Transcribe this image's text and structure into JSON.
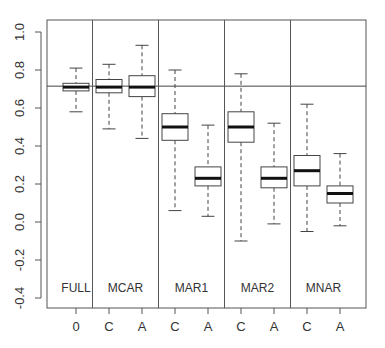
{
  "chart_data": {
    "type": "boxplot",
    "title": "",
    "xlabel": "",
    "ylabel": "",
    "ylim": [
      -0.45,
      1.05
    ],
    "yticks": [
      -0.4,
      -0.2,
      0.0,
      0.2,
      0.4,
      0.6,
      0.8,
      1.0
    ],
    "ytick_labels": [
      "-0.4",
      "-0.2",
      "0.0",
      "0.2",
      "0.4",
      "0.6",
      "0.8",
      "1.0"
    ],
    "reference_line": 0.715,
    "grid": false,
    "groups": [
      {
        "name": "FULL",
        "boxes": [
          {
            "label": "0",
            "whisker_high": 0.81,
            "q3": 0.73,
            "median": 0.71,
            "q1": 0.69,
            "whisker_low": 0.58
          }
        ]
      },
      {
        "name": "MCAR",
        "boxes": [
          {
            "label": "C",
            "whisker_high": 0.83,
            "q3": 0.75,
            "median": 0.71,
            "q1": 0.68,
            "whisker_low": 0.49
          },
          {
            "label": "A",
            "whisker_high": 0.93,
            "q3": 0.77,
            "median": 0.71,
            "q1": 0.66,
            "whisker_low": 0.44
          }
        ]
      },
      {
        "name": "MAR1",
        "boxes": [
          {
            "label": "C",
            "whisker_high": 0.8,
            "q3": 0.57,
            "median": 0.5,
            "q1": 0.43,
            "whisker_low": 0.06
          },
          {
            "label": "A",
            "whisker_high": 0.51,
            "q3": 0.29,
            "median": 0.23,
            "q1": 0.19,
            "whisker_low": 0.03
          }
        ]
      },
      {
        "name": "MAR2",
        "boxes": [
          {
            "label": "C",
            "whisker_high": 0.78,
            "q3": 0.58,
            "median": 0.5,
            "q1": 0.42,
            "whisker_low": -0.1
          },
          {
            "label": "A",
            "whisker_high": 0.52,
            "q3": 0.29,
            "median": 0.23,
            "q1": 0.18,
            "whisker_low": -0.01
          }
        ]
      },
      {
        "name": "MNAR",
        "boxes": [
          {
            "label": "C",
            "whisker_high": 0.62,
            "q3": 0.35,
            "median": 0.27,
            "q1": 0.19,
            "whisker_low": -0.05
          },
          {
            "label": "A",
            "whisker_high": 0.36,
            "q3": 0.19,
            "median": 0.15,
            "q1": 0.1,
            "whisker_low": -0.02
          }
        ]
      }
    ],
    "categories": [
      "0",
      "C",
      "A",
      "C",
      "A",
      "C",
      "A",
      "C",
      "A"
    ]
  }
}
